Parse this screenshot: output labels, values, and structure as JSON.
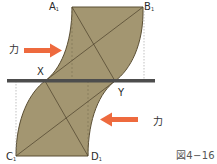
{
  "diagram": {
    "caption": "図4−16",
    "colors": {
      "fill": "#a39671",
      "outline": "#5a4e33",
      "diagonal": "#4a3f2a",
      "bar": "#4d4d4d",
      "arrow": "#ee6a3e",
      "dashed": "#999999"
    },
    "points": {
      "A1": {
        "letter": "A",
        "sub": "1"
      },
      "B1": {
        "letter": "B",
        "sub": "1"
      },
      "C1": {
        "letter": "C",
        "sub": "1"
      },
      "D1": {
        "letter": "D",
        "sub": "1"
      },
      "X": {
        "letter": "X"
      },
      "Y": {
        "letter": "Y"
      }
    },
    "forces": [
      {
        "label": "力",
        "direction": "right",
        "position": "upper-left"
      },
      {
        "label": "力",
        "direction": "left",
        "position": "lower-right"
      }
    ]
  }
}
